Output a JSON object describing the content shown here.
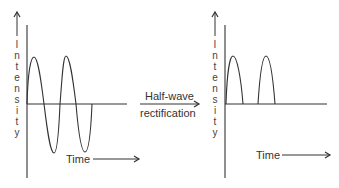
{
  "diagram": {
    "left_panel": {
      "y_label_letters": [
        "I",
        "n",
        "t",
        "e",
        "n",
        "s",
        "i",
        "t",
        "y"
      ],
      "y_label": "Intensity",
      "x_label": "Time",
      "signal": "full sine wave (AC), two cycles"
    },
    "transform": {
      "line1": "Half-wave",
      "line2": "rectification"
    },
    "right_panel": {
      "y_label_letters": [
        "I",
        "n",
        "t",
        "e",
        "n",
        "s",
        "i",
        "t",
        "y"
      ],
      "y_label": "Intensity",
      "x_label": "Time",
      "signal": "positive half-cycles only"
    },
    "colors": {
      "stroke": "#333333",
      "background": "#ffffff"
    }
  }
}
